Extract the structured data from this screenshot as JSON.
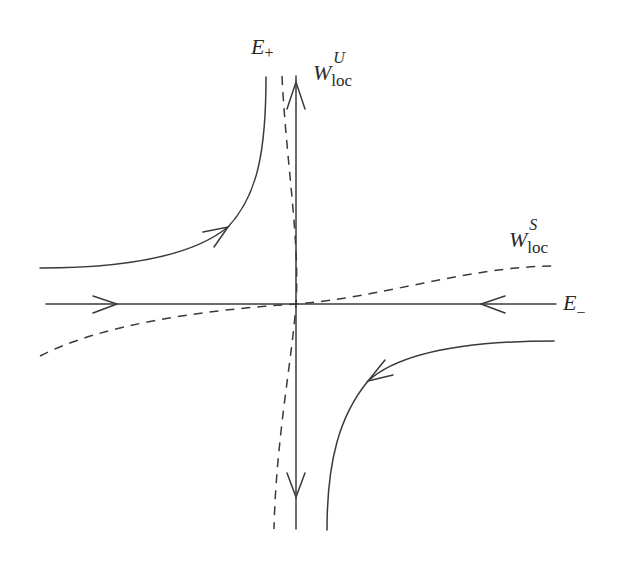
{
  "diagram": {
    "type": "phase-portrait-saddle",
    "labels": {
      "e_plus": {
        "base": "E",
        "sub": "+"
      },
      "e_minus": {
        "base": "E",
        "sub": "−"
      },
      "w_unstable": {
        "base": "W",
        "sup": "U",
        "sub": "loc"
      },
      "w_stable": {
        "base": "W",
        "sup": "S",
        "sub": "loc"
      }
    },
    "colors": {
      "stroke": "#3a3a3a",
      "background": "#ffffff"
    },
    "elements": [
      "vertical axis E+ with arrows pointing away from origin",
      "horizontal axis E- with arrows pointing toward origin",
      "dashed curve W^U_loc tangent to E+",
      "dashed curve W^S_loc tangent to E-",
      "hyperbolic trajectory in upper-left quadrant",
      "hyperbolic trajectory in lower-right quadrant"
    ]
  }
}
